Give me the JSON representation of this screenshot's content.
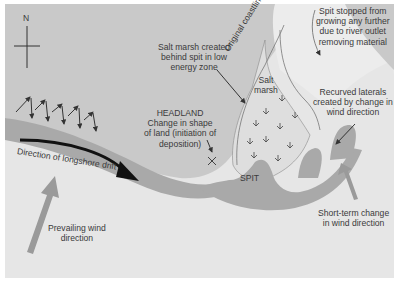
{
  "diagram": {
    "colors": {
      "frame": "#ffffff",
      "sea": "#e6e6e6",
      "land": "#c9c9c9",
      "beach_band": "#a9a9a9",
      "salt_marsh": "#dedede",
      "river_area": "#ececec",
      "wind_arrow": "#9a9a9a",
      "text": "#3a3a3a",
      "drift_arrow": "#111111"
    },
    "compass": {
      "label": "N"
    },
    "labels": {
      "salt_marsh_created": [
        "Salt marsh created",
        "behind spit in low",
        "energy zone"
      ],
      "original_coastline": "Original coastline",
      "salt_marsh": [
        "Salt",
        "marsh"
      ],
      "spit_stopped": [
        "Spit stopped from",
        "growing any further",
        "due to river outlet",
        "removing material"
      ],
      "recurved_laterals": [
        "Recurved laterals",
        "created by change in",
        "wind direction"
      ],
      "headland": [
        "HEADLAND",
        "Change in shape",
        "of land (initiation of",
        "deposition)"
      ],
      "longshore_drift": "Direction of longshore drift",
      "spit": "SPIT",
      "prevailing_wind": [
        "Prevailing wind",
        "direction"
      ],
      "short_term_change": [
        "Short-term change",
        "in wind direction"
      ]
    }
  }
}
